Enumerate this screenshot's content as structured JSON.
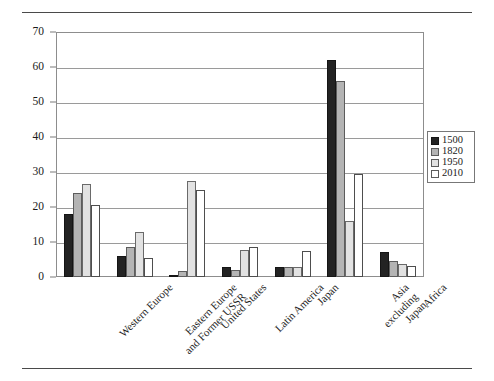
{
  "chart_data": {
    "type": "bar",
    "title": "",
    "xlabel": "",
    "ylabel": "",
    "ylim": [
      0,
      70
    ],
    "yticks": [
      0,
      10,
      20,
      30,
      40,
      50,
      60,
      70
    ],
    "grid": true,
    "legend_position": "right",
    "categories": [
      "Western Europe",
      "Eastern Europe and Former USSR",
      "United States",
      "Latin America",
      "Japan",
      "Asia excluding Japan",
      "Africa"
    ],
    "category_lines": [
      [
        "Western Europe"
      ],
      [
        "Eastern Europe",
        "and Former USSR"
      ],
      [
        "United States"
      ],
      [
        "Latin America"
      ],
      [
        "Japan"
      ],
      [
        "Asia",
        "excluding",
        "Japan"
      ],
      [
        "Africa"
      ]
    ],
    "series": [
      {
        "name": "1500",
        "color": "#232323",
        "values": [
          18.0,
          6.0,
          0.3,
          3.0,
          3.0,
          62.0,
          7.2
        ]
      },
      {
        "name": "1820",
        "color": "#b4b4b4",
        "values": [
          24.0,
          8.7,
          1.8,
          2.0,
          3.0,
          56.0,
          4.5
        ]
      },
      {
        "name": "1950",
        "color": "#e2e2e2",
        "values": [
          26.5,
          13.0,
          27.3,
          7.8,
          3.0,
          16.0,
          3.6
        ]
      },
      {
        "name": "2010",
        "color": "#ffffff",
        "values": [
          20.5,
          5.5,
          25.0,
          8.7,
          7.5,
          29.5,
          3.2
        ]
      }
    ]
  },
  "legend": {
    "entries": [
      {
        "label": "1500"
      },
      {
        "label": "1820"
      },
      {
        "label": "1950"
      },
      {
        "label": "2010"
      }
    ]
  },
  "colors": {
    "series_1500": "#232323",
    "series_1820": "#b4b4b4",
    "series_1950": "#e2e2e2",
    "series_2010": "#ffffff",
    "axis": "#8d8d8d",
    "gridline": "#9a9a9a",
    "rule": "#4a4a4a"
  }
}
